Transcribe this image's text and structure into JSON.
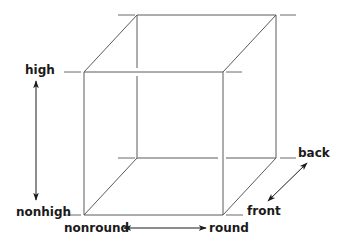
{
  "diagram": {
    "type": "cube-dimensions",
    "labels": {
      "high": "high",
      "nonhigh": "nonhigh",
      "nonround": "nonround",
      "round": "round",
      "back": "back",
      "front": "front"
    },
    "axes": [
      {
        "name": "vertical",
        "from": "nonhigh",
        "to": "high"
      },
      {
        "name": "horizontal",
        "from": "nonround",
        "to": "round"
      },
      {
        "name": "depth",
        "from": "front",
        "to": "back"
      }
    ],
    "colors": {
      "edge": "#5a5a5a",
      "text": "#1a1a1a",
      "background": "#ffffff"
    }
  }
}
